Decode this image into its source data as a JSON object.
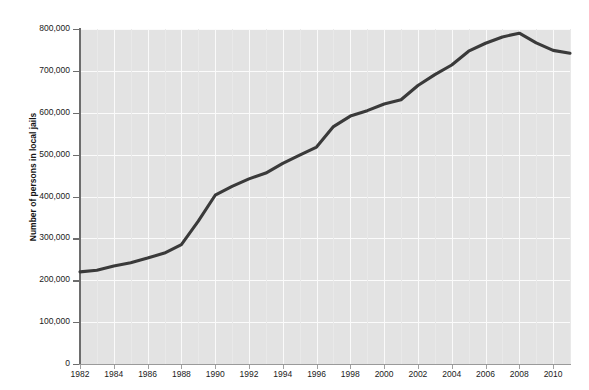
{
  "figure": {
    "faint_top_caption": "",
    "background_color": "#ffffff",
    "plot_background_color": "#e3e3e3",
    "gridline_color": "#fbfbfb",
    "line_color": "#3a3a3a",
    "axis_color": "#6d6d6d"
  },
  "chart_data": {
    "type": "line",
    "title": "",
    "subtitle": "",
    "xlabel": "",
    "ylabel": "Number of persons in local jails",
    "xlim": [
      1982,
      2011
    ],
    "ylim": [
      0,
      800000
    ],
    "grid": true,
    "legend_position": "none",
    "x_tick_labels": [
      "1982",
      "1984",
      "1986",
      "1988",
      "1990",
      "1992",
      "1994",
      "1996",
      "1998",
      "2000",
      "2002",
      "2004",
      "2006",
      "2008",
      "2010"
    ],
    "x_ticks": [
      1982,
      1984,
      1986,
      1988,
      1990,
      1992,
      1994,
      1996,
      1998,
      2000,
      2002,
      2004,
      2006,
      2008,
      2010
    ],
    "y_tick_labels": [
      "0",
      "100,000",
      "200,000",
      "300,000",
      "400,000",
      "500,000",
      "600,000",
      "700,000",
      "800,000"
    ],
    "y_ticks": [
      0,
      100000,
      200000,
      300000,
      400000,
      500000,
      600000,
      700000,
      800000
    ],
    "series": [
      {
        "name": "Persons in local jails",
        "x": [
          1982,
          1983,
          1984,
          1985,
          1986,
          1987,
          1988,
          1989,
          1990,
          1991,
          1992,
          1993,
          1994,
          1995,
          1996,
          1997,
          1998,
          1999,
          2000,
          2001,
          2002,
          2003,
          2004,
          2005,
          2006,
          2007,
          2008,
          2009,
          2010,
          2011
        ],
        "values": [
          220000,
          224000,
          234000,
          242000,
          253000,
          265000,
          285000,
          341000,
          403000,
          424000,
          442000,
          456000,
          479000,
          499000,
          518000,
          567000,
          592000,
          605000,
          621000,
          631000,
          665000,
          691000,
          714000,
          747000,
          766000,
          781000,
          790000,
          767000,
          749000,
          742000
        ]
      }
    ],
    "annotations": []
  }
}
